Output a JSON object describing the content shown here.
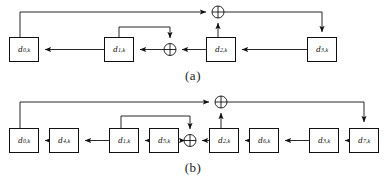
{
  "figure": {
    "kind": "lfsr-feedback-shift-register-diagram",
    "panels": [
      {
        "id": "a",
        "caption": "(a)",
        "register_count": 4,
        "registers": [
          {
            "name": "d0k",
            "base": "d",
            "sub": "0,k",
            "x": 9,
            "y": 37,
            "w": 30,
            "h": 25
          },
          {
            "name": "d1k",
            "base": "d",
            "sub": "1,k",
            "x": 104,
            "y": 37,
            "w": 30,
            "h": 25
          },
          {
            "name": "d2k",
            "base": "d",
            "sub": "2,k",
            "x": 206,
            "y": 37,
            "w": 30,
            "h": 25
          },
          {
            "name": "d3k",
            "base": "d",
            "sub": "3,k",
            "x": 307,
            "y": 37,
            "w": 30,
            "h": 25
          }
        ],
        "xor_gates": [
          {
            "name": "xor-top-a",
            "cx": 218,
            "cy": 12,
            "r": 6
          },
          {
            "name": "xor-middle-a",
            "cx": 170,
            "cy": 49,
            "r": 6
          }
        ],
        "feedback_line_y": 12,
        "inner_loop_y": 27
      },
      {
        "id": "b",
        "caption": "(b)",
        "register_count": 8,
        "registers": [
          {
            "name": "d0k",
            "base": "d",
            "sub": "0,k",
            "x": 9,
            "y": 128,
            "w": 30,
            "h": 25
          },
          {
            "name": "d4k",
            "base": "d",
            "sub": "4,k",
            "x": 49,
            "y": 128,
            "w": 30,
            "h": 25
          },
          {
            "name": "d1k",
            "base": "d",
            "sub": "1,k",
            "x": 109,
            "y": 128,
            "w": 30,
            "h": 25
          },
          {
            "name": "d5k",
            "base": "d",
            "sub": "5,k",
            "x": 149,
            "y": 128,
            "w": 30,
            "h": 25
          },
          {
            "name": "d2k",
            "base": "d",
            "sub": "2,k",
            "x": 209,
            "y": 128,
            "w": 30,
            "h": 25
          },
          {
            "name": "d6k",
            "base": "d",
            "sub": "6,k",
            "x": 249,
            "y": 128,
            "w": 30,
            "h": 25
          },
          {
            "name": "d3k",
            "base": "d",
            "sub": "3,k",
            "x": 309,
            "y": 128,
            "w": 30,
            "h": 25
          },
          {
            "name": "d7k",
            "base": "d",
            "sub": "7,k",
            "x": 349,
            "y": 128,
            "w": 30,
            "h": 25
          }
        ],
        "xor_gates": [
          {
            "name": "xor-top-b",
            "cx": 221,
            "cy": 102,
            "r": 6
          },
          {
            "name": "xor-middle-b",
            "cx": 190,
            "cy": 143,
            "r": 6
          }
        ],
        "feedback_line_y": 102,
        "inner_loop_y": 116
      }
    ],
    "colors": {
      "stroke": "#111111",
      "background": "#ffffff",
      "text": "#1a1a1a"
    }
  }
}
